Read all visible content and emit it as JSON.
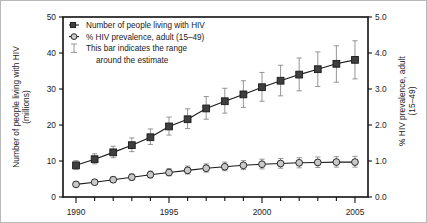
{
  "chart_data": {
    "type": "line",
    "title": "",
    "xlabel": "",
    "x": [
      1990,
      1991,
      1992,
      1993,
      1994,
      1995,
      1996,
      1997,
      1998,
      1999,
      2000,
      2001,
      2002,
      2003,
      2004,
      2005
    ],
    "xlim": [
      1989.3,
      2005.7
    ],
    "xticks_major": [
      "1990",
      "1995",
      "2000",
      "2005"
    ],
    "xtick_values_major": [
      1990,
      1995,
      2000,
      2005
    ],
    "grid": false,
    "legend_position": "top-left",
    "left_axis": {
      "label": "Number of people living with HIV (millions)",
      "ylim": [
        0,
        50
      ],
      "ticks": [
        "0",
        "10",
        "20",
        "30",
        "40",
        "50"
      ],
      "tick_values": [
        0,
        10,
        20,
        30,
        40,
        50
      ]
    },
    "right_axis": {
      "label": "% HIV prevalence, adult (15–49)",
      "ylim": [
        0.0,
        5.0
      ],
      "ticks": [
        "0.0",
        "1.0",
        "2.0",
        "3.0",
        "4.0",
        "5.0"
      ],
      "tick_values": [
        0.0,
        1.0,
        2.0,
        3.0,
        4.0,
        5.0
      ]
    },
    "series": [
      {
        "name": "Number of people living with HIV",
        "marker": "square",
        "axis": "left",
        "color": "#3f3f3f",
        "values": [
          8.8,
          10.5,
          12.4,
          14.4,
          16.6,
          19.6,
          21.6,
          24.6,
          26.6,
          28.5,
          30.5,
          32.3,
          34.0,
          35.5,
          37.0,
          38.1
        ],
        "error_low": [
          7.6,
          9.2,
          10.9,
          12.6,
          14.6,
          17.2,
          19.0,
          21.6,
          23.3,
          24.9,
          26.6,
          28.1,
          29.5,
          30.7,
          31.9,
          32.8
        ],
        "error_high": [
          10.1,
          12.0,
          14.1,
          16.4,
          18.9,
          22.2,
          24.5,
          27.9,
          30.2,
          32.3,
          34.6,
          36.6,
          38.6,
          40.3,
          42.0,
          43.4
        ]
      },
      {
        "name": "% HIV prevalence, adult (15–49)",
        "marker": "circle",
        "axis": "right",
        "color": "#c9c9c9",
        "values": [
          0.35,
          0.41,
          0.48,
          0.55,
          0.62,
          0.68,
          0.74,
          0.8,
          0.84,
          0.88,
          0.91,
          0.93,
          0.95,
          0.96,
          0.97,
          0.97
        ],
        "error_low": [
          0.3,
          0.35,
          0.41,
          0.47,
          0.53,
          0.59,
          0.64,
          0.69,
          0.73,
          0.76,
          0.78,
          0.8,
          0.81,
          0.82,
          0.83,
          0.83
        ],
        "error_high": [
          0.41,
          0.48,
          0.56,
          0.64,
          0.72,
          0.79,
          0.86,
          0.92,
          0.97,
          1.01,
          1.05,
          1.07,
          1.09,
          1.11,
          1.12,
          1.13
        ]
      }
    ],
    "legend": [
      {
        "label": "Number of people living with HIV",
        "marker": "square-line"
      },
      {
        "label": "% HIV prevalence, adult (15–49)",
        "marker": "circle-line"
      },
      {
        "label": "This bar indicates the range",
        "marker": "errorbar"
      },
      {
        "label": "around the estimate",
        "marker": "none"
      }
    ]
  }
}
